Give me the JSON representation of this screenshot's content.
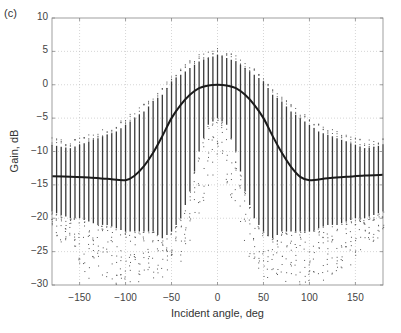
{
  "chart_data": {
    "type": "scatter",
    "panel_label": "(c)",
    "title": "",
    "xlabel": "Incident angle, deg",
    "ylabel": "Gain, dB",
    "xlim": [
      -180,
      180
    ],
    "ylim": [
      -30,
      10
    ],
    "xticks": [
      -150,
      -100,
      -50,
      0,
      50,
      100,
      150
    ],
    "yticks": [
      10,
      5,
      0,
      -5,
      -10,
      -15,
      -20,
      -25,
      -30
    ],
    "grid": true,
    "grid_style": "dotted",
    "legend": null,
    "series": [
      {
        "name": "gain samples (vertical scatter per angle)",
        "type": "scatter",
        "angle_step_deg": 5,
        "x": [
          -180,
          -170,
          -160,
          -150,
          -140,
          -130,
          -120,
          -110,
          -100,
          -90,
          -80,
          -70,
          -60,
          -50,
          -40,
          -30,
          -20,
          -10,
          0,
          10,
          20,
          30,
          40,
          50,
          60,
          70,
          80,
          90,
          100,
          110,
          120,
          130,
          140,
          150,
          160,
          170,
          180
        ],
        "upper_envelope": [
          -9,
          -9.3,
          -9.5,
          -9,
          -8.5,
          -8,
          -7.5,
          -7,
          -6,
          -5,
          -4,
          -2.5,
          -1.5,
          0.5,
          1.5,
          2.5,
          3.5,
          4,
          4.5,
          4,
          3.5,
          2.5,
          1.5,
          0.5,
          -1.5,
          -2.5,
          -4,
          -5,
          -6,
          -7,
          -7.5,
          -8,
          -8.5,
          -9,
          -9.5,
          -9.3,
          -9
        ],
        "dense_lower": [
          -19,
          -19.5,
          -20,
          -20,
          -20.5,
          -21,
          -21,
          -21.5,
          -22,
          -22,
          -22,
          -22,
          -23,
          -22,
          -20,
          -16,
          -10,
          -6,
          -5,
          -6,
          -10,
          -16,
          -20,
          -22,
          -23,
          -22,
          -22,
          -22,
          -22,
          -21.5,
          -21,
          -21,
          -20.5,
          -20,
          -20,
          -19.5,
          -19
        ],
        "sparse_min": [
          -22,
          -24,
          -23,
          -27,
          -29,
          -28,
          -29,
          -30,
          -30,
          -30,
          -30,
          -30,
          -29,
          -29,
          -28,
          -24,
          -20,
          -15,
          -12,
          -15,
          -20,
          -24,
          -28,
          -29,
          -29,
          -30,
          -30,
          -30,
          -30,
          -30,
          -29,
          -28,
          -29,
          -27,
          -23,
          -24,
          -22
        ]
      },
      {
        "name": "mean gain",
        "type": "line",
        "x": [
          -180,
          -160,
          -140,
          -120,
          -100,
          -90,
          -80,
          -70,
          -60,
          -50,
          -40,
          -30,
          -20,
          -10,
          0,
          10,
          20,
          30,
          40,
          50,
          60,
          70,
          80,
          90,
          100,
          120,
          140,
          160,
          180
        ],
        "y": [
          -13.7,
          -13.8,
          -13.9,
          -14.1,
          -14.3,
          -13.6,
          -12.2,
          -10.2,
          -7.7,
          -5.0,
          -3.0,
          -1.5,
          -0.5,
          -0.1,
          0,
          -0.1,
          -0.5,
          -1.5,
          -3.0,
          -5.0,
          -7.7,
          -10.2,
          -12.3,
          -13.8,
          -14.3,
          -14.0,
          -13.8,
          -13.6,
          -13.5
        ]
      }
    ]
  }
}
